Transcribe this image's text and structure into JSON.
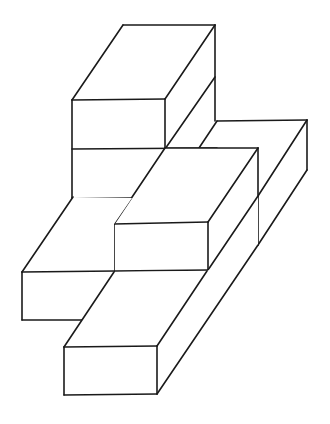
{
  "figure": {
    "type": "isometric-block-structure",
    "background": "#ffffff",
    "stroke_color": "#1a1a1a",
    "block_count": 6,
    "blocks": [
      {
        "id": "top-upper",
        "label": "upper stacked block (back)"
      },
      {
        "id": "top-lower",
        "label": "lower stacked block (back)"
      },
      {
        "id": "right-long",
        "label": "right long block"
      },
      {
        "id": "middle",
        "label": "middle block"
      },
      {
        "id": "left-front",
        "label": "left block"
      },
      {
        "id": "bottom-front",
        "label": "bottom front block"
      }
    ]
  }
}
